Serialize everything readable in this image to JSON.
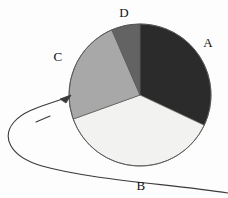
{
  "figure": {
    "background_color": "#fdfdfd",
    "width": 228,
    "height": 198,
    "label_color": "#111111",
    "outline_color": "#555555"
  },
  "annotation": {
    "name": "curved-pointer-arrow",
    "color": "#3a3a3a",
    "points_to_slice": "C",
    "description": "long curved arrow sweeping from lower right, looping left, arrowhead aimed at slice C"
  },
  "chart_data": {
    "type": "pie",
    "title": "",
    "labels": [
      "A",
      "B",
      "C",
      "D"
    ],
    "values": [
      32.0,
      37.5,
      24.0,
      6.5
    ],
    "units": "percent",
    "colors": [
      "#2b2b2b",
      "#f2f2f0",
      "#a8a8a8",
      "#636363"
    ],
    "start_angle_deg": 0,
    "direction": "clockwise",
    "center_x": 140,
    "center_y": 95,
    "radius": 71,
    "legend": "none",
    "grid": false,
    "slice_boundaries_deg": [
      0,
      115.2,
      250.2,
      336.6,
      360
    ],
    "label_positions": [
      {
        "label": "A",
        "x": 208,
        "y": 42
      },
      {
        "label": "B",
        "x": 141,
        "y": 185
      },
      {
        "label": "C",
        "x": 58,
        "y": 56
      },
      {
        "label": "D",
        "x": 124,
        "y": 12
      }
    ]
  }
}
